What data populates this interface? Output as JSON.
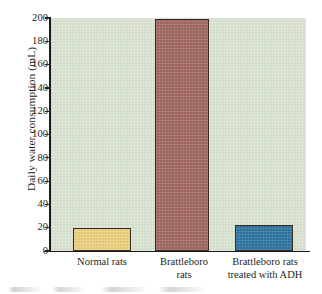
{
  "chart_data": {
    "type": "bar",
    "title": "",
    "xlabel": "",
    "ylabel": "Daily water consumption (mL)",
    "categories": [
      "Normal rats",
      "Brattleboro rats",
      "Brattleboro rats treated with ADH"
    ],
    "category_lines": [
      [
        "Normal rats"
      ],
      [
        "Brattleboro",
        "rats"
      ],
      [
        "Brattleboro rats",
        "treated with ADH"
      ]
    ],
    "values": [
      20,
      199,
      22
    ],
    "ylim": [
      0,
      200
    ],
    "yticks": [
      0,
      20,
      40,
      60,
      80,
      100,
      120,
      140,
      160,
      180,
      200
    ],
    "ytick_labels": [
      "0",
      "20",
      "40",
      "60",
      "80",
      "100",
      "120",
      "140",
      "160",
      "180",
      "200"
    ],
    "grid": false,
    "legend": "none",
    "bar_colors": [
      "#f2d582",
      "#a66a63",
      "#2f78a5"
    ],
    "bar_border_color": "#3a2b22",
    "plot_background": "#d8e3cf",
    "axis_color": "#1c1a18",
    "text_color": "#241f1b"
  }
}
